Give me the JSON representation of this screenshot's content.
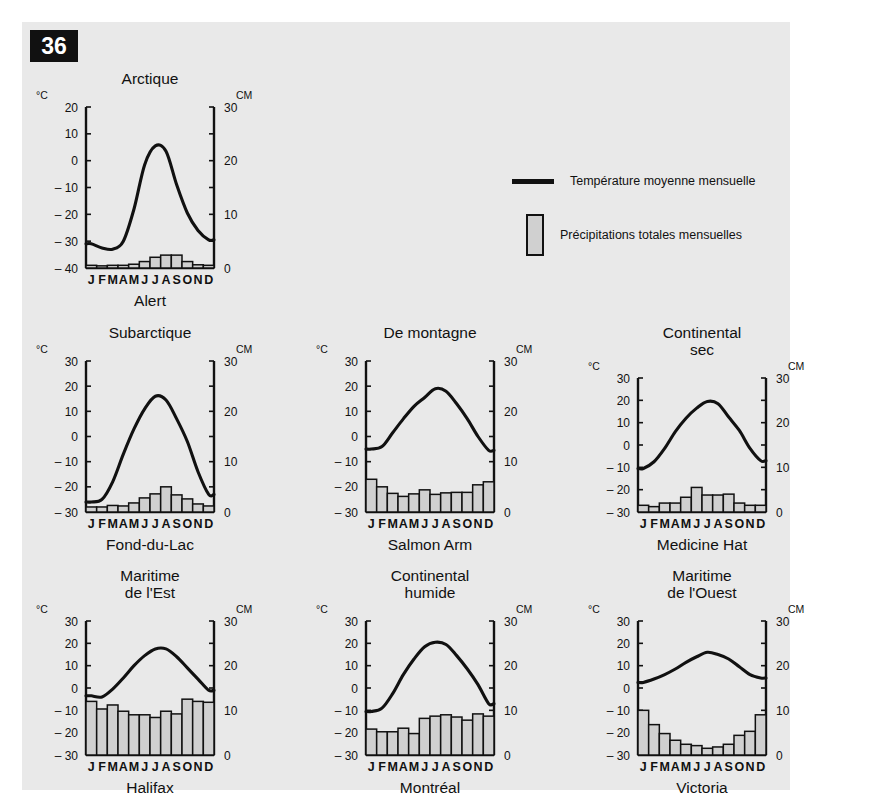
{
  "page": {
    "number": "36",
    "background": "#e9e9e9",
    "ink": "#111111",
    "bar_fill": "#d0d0d0"
  },
  "legend": {
    "temperature": {
      "icon": "line-swatch",
      "label": "Température moyenne mensuelle"
    },
    "precipitation": {
      "icon": "bar-swatch",
      "label": "Précipitations totales mensuelles"
    }
  },
  "axes": {
    "left_unit": "°C",
    "right_unit": "CM",
    "months": [
      "J",
      "F",
      "M",
      "A",
      "M",
      "J",
      "J",
      "A",
      "S",
      "O",
      "N",
      "D"
    ]
  },
  "chart_data": [
    {
      "id": "alert",
      "type": "bar",
      "title": "Arctique",
      "city": "Alert",
      "xlabel": "",
      "ylabel": "°C",
      "y2label": "CM",
      "categories": [
        "J",
        "F",
        "M",
        "A",
        "M",
        "J",
        "J",
        "A",
        "S",
        "O",
        "N",
        "D"
      ],
      "temp_ticks": [
        20,
        10,
        0,
        -10,
        -20,
        -30,
        -40
      ],
      "precip_ticks": [
        0,
        10,
        20,
        30
      ],
      "ylim": [
        -40,
        20
      ],
      "y2lim": [
        0,
        30
      ],
      "grid": false,
      "series": [
        {
          "name": "Température moyenne mensuelle",
          "type": "line",
          "values": [
            -31,
            -32.5,
            -33,
            -30,
            -18,
            -1.5,
            5.5,
            3.5,
            -9,
            -19.5,
            -26,
            -29.5
          ]
        },
        {
          "name": "Précipitations totales mensuelles",
          "type": "bar",
          "values": [
            0.5,
            0.4,
            0.5,
            0.5,
            0.7,
            1.2,
            2.0,
            2.4,
            2.4,
            1.2,
            0.6,
            0.5
          ]
        }
      ]
    },
    {
      "id": "fond-du-lac",
      "type": "bar",
      "title": "Subarctique",
      "city": "Fond-du-Lac",
      "xlabel": "",
      "ylabel": "°C",
      "y2label": "CM",
      "categories": [
        "J",
        "F",
        "M",
        "A",
        "M",
        "J",
        "J",
        "A",
        "S",
        "O",
        "N",
        "D"
      ],
      "temp_ticks": [
        30,
        20,
        10,
        0,
        -10,
        -20,
        -30
      ],
      "precip_ticks": [
        0,
        10,
        20,
        30
      ],
      "ylim": [
        -30,
        30
      ],
      "y2lim": [
        0,
        30
      ],
      "grid": false,
      "series": [
        {
          "name": "Température moyenne mensuelle",
          "type": "line",
          "values": [
            -26,
            -25,
            -18,
            -7,
            3,
            11,
            16,
            14.5,
            7,
            -2,
            -14,
            -23
          ]
        },
        {
          "name": "Précipitations totales mensuelles",
          "type": "bar",
          "values": [
            1.0,
            1.0,
            1.3,
            1.2,
            1.8,
            2.8,
            3.6,
            5.0,
            3.4,
            2.6,
            1.6,
            1.2
          ]
        }
      ]
    },
    {
      "id": "salmon-arm",
      "type": "bar",
      "title": "De montagne",
      "city": "Salmon  Arm",
      "xlabel": "",
      "ylabel": "°C",
      "y2label": "CM",
      "categories": [
        "J",
        "F",
        "M",
        "A",
        "M",
        "J",
        "J",
        "A",
        "S",
        "O",
        "N",
        "D"
      ],
      "temp_ticks": [
        30,
        20,
        10,
        0,
        -10,
        -20,
        -30
      ],
      "precip_ticks": [
        0,
        10,
        20,
        30
      ],
      "ylim": [
        -30,
        30
      ],
      "y2lim": [
        0,
        30
      ],
      "grid": false,
      "series": [
        {
          "name": "Température moyenne mensuelle",
          "type": "line",
          "values": [
            -5,
            -4,
            1.5,
            7,
            12,
            15.5,
            19,
            18,
            13,
            7,
            0,
            -5.5
          ]
        },
        {
          "name": "Précipitations totales mensuelles",
          "type": "bar",
          "values": [
            6.5,
            5.0,
            3.7,
            3.1,
            3.6,
            4.4,
            3.5,
            3.8,
            3.9,
            3.9,
            5.4,
            6.0
          ]
        }
      ]
    },
    {
      "id": "medicine-hat",
      "type": "bar",
      "title": "Continental sec",
      "city": "Medicine Hat",
      "xlabel": "",
      "ylabel": "°C",
      "y2label": "CM",
      "categories": [
        "J",
        "F",
        "M",
        "A",
        "M",
        "J",
        "J",
        "A",
        "S",
        "O",
        "N",
        "D"
      ],
      "temp_ticks": [
        30,
        20,
        10,
        0,
        -10,
        -20,
        -30
      ],
      "precip_ticks": [
        0,
        10,
        20,
        30
      ],
      "ylim": [
        -30,
        30
      ],
      "y2lim": [
        0,
        30
      ],
      "grid": false,
      "series": [
        {
          "name": "Température moyenne mensuelle",
          "type": "line",
          "values": [
            -10.5,
            -7.5,
            -1.5,
            6,
            12,
            16.5,
            19.5,
            18.5,
            12.5,
            6.5,
            -1.5,
            -7
          ]
        },
        {
          "name": "Précipitations totales mensuelles",
          "type": "bar",
          "values": [
            1.5,
            1.2,
            2.0,
            2.0,
            3.3,
            5.5,
            3.8,
            3.8,
            4.0,
            2.0,
            1.5,
            1.5
          ]
        }
      ]
    },
    {
      "id": "halifax",
      "type": "bar",
      "title": "Maritime de l'Est",
      "city": "Halifax",
      "xlabel": "",
      "ylabel": "°C",
      "y2label": "CM",
      "categories": [
        "J",
        "F",
        "M",
        "A",
        "M",
        "J",
        "J",
        "A",
        "S",
        "O",
        "N",
        "D"
      ],
      "temp_ticks": [
        30,
        20,
        10,
        0,
        -10,
        -20,
        -30
      ],
      "precip_ticks": [
        0,
        10,
        20,
        30
      ],
      "ylim": [
        -30,
        30
      ],
      "y2lim": [
        0,
        30
      ],
      "grid": false,
      "series": [
        {
          "name": "Température moyenne mensuelle",
          "type": "line",
          "values": [
            -3.5,
            -4,
            -0.5,
            4.5,
            10,
            14.5,
            17.5,
            17.5,
            14,
            9,
            4,
            -1
          ]
        },
        {
          "name": "Précipitations totales mensuelles",
          "type": "bar",
          "values": [
            12.0,
            10.3,
            11.2,
            9.8,
            9.0,
            9.0,
            8.4,
            9.8,
            9.2,
            12.5,
            12.0,
            11.8
          ]
        }
      ]
    },
    {
      "id": "montreal",
      "type": "bar",
      "title": "Continental humide",
      "city": "Montréal",
      "xlabel": "",
      "ylabel": "°C",
      "y2label": "CM",
      "categories": [
        "J",
        "F",
        "M",
        "A",
        "M",
        "J",
        "J",
        "A",
        "S",
        "O",
        "N",
        "D"
      ],
      "temp_ticks": [
        30,
        20,
        10,
        0,
        -10,
        -20,
        -30
      ],
      "precip_ticks": [
        0,
        10,
        20,
        30
      ],
      "ylim": [
        -30,
        30
      ],
      "y2lim": [
        0,
        30
      ],
      "grid": false,
      "series": [
        {
          "name": "Température moyenne mensuelle",
          "type": "line",
          "values": [
            -10.5,
            -9,
            -2.5,
            6,
            13,
            18.5,
            20.5,
            19.5,
            14.5,
            8.5,
            1.5,
            -7
          ]
        },
        {
          "name": "Précipitations totales mensuelles",
          "type": "bar",
          "values": [
            5.8,
            5.2,
            5.2,
            6.0,
            4.8,
            8.2,
            8.7,
            9.0,
            8.5,
            7.8,
            9.2,
            8.7
          ]
        }
      ]
    },
    {
      "id": "victoria",
      "type": "bar",
      "title": "Maritime de l'Ouest",
      "city": "Victoria",
      "xlabel": "",
      "ylabel": "°C",
      "y2label": "CM",
      "categories": [
        "J",
        "F",
        "M",
        "A",
        "M",
        "J",
        "J",
        "A",
        "S",
        "O",
        "N",
        "D"
      ],
      "temp_ticks": [
        30,
        20,
        10,
        0,
        -10,
        -20,
        -30
      ],
      "precip_ticks": [
        0,
        10,
        20,
        30
      ],
      "ylim": [
        -30,
        30
      ],
      "y2lim": [
        0,
        30
      ],
      "grid": false,
      "series": [
        {
          "name": "Température moyenne mensuelle",
          "type": "line",
          "values": [
            2.5,
            4,
            6,
            8.5,
            11.5,
            14,
            16,
            15,
            13,
            9.5,
            6,
            4.5
          ]
        },
        {
          "name": "Précipitations totales mensuelles",
          "type": "bar",
          "values": [
            10.0,
            6.8,
            4.8,
            3.3,
            2.4,
            2.1,
            1.5,
            1.8,
            2.4,
            4.4,
            5.3,
            9.0,
            11.5
          ]
        }
      ]
    }
  ],
  "layout": {
    "charts": [
      {
        "id": "alert",
        "left": 8,
        "top": 48,
        "width": 240,
        "height": 250,
        "title_lines": [
          "Arctique"
        ]
      },
      {
        "id": "fond-du-lac",
        "left": 8,
        "top": 302,
        "width": 240,
        "height": 240,
        "title_lines": [
          "Subarctique"
        ]
      },
      {
        "id": "salmon-arm",
        "left": 288,
        "top": 302,
        "width": 240,
        "height": 240,
        "title_lines": [
          "De montagne"
        ]
      },
      {
        "id": "medicine-hat",
        "left": 560,
        "top": 302,
        "width": 240,
        "height": 240,
        "title_lines": [
          "Continental",
          "sec"
        ]
      },
      {
        "id": "halifax",
        "left": 8,
        "top": 545,
        "width": 240,
        "height": 240,
        "title_lines": [
          "Maritime",
          "de l'Est"
        ]
      },
      {
        "id": "montreal",
        "left": 288,
        "top": 545,
        "width": 240,
        "height": 240,
        "title_lines": [
          "Continental",
          "humide"
        ]
      },
      {
        "id": "victoria",
        "left": 560,
        "top": 545,
        "width": 240,
        "height": 240,
        "title_lines": [
          "Maritime",
          "de l'Ouest"
        ]
      }
    ]
  }
}
